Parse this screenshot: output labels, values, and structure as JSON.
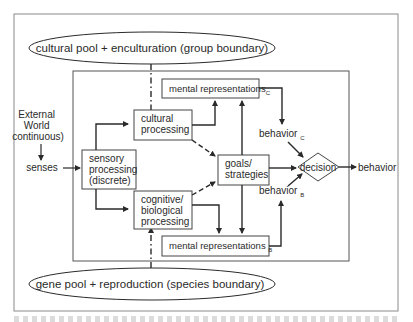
{
  "diagram": {
    "top_ellipse": {
      "label": "cultural  pool + enculturation (group boundary)"
    },
    "bottom_ellipse": {
      "label": "gene pool + reproduction (species boundary)"
    },
    "external_world": {
      "lines": [
        "External",
        "World",
        "continuous)"
      ]
    },
    "senses": {
      "label": "senses"
    },
    "sensory_processing": {
      "lines": [
        "sensory",
        "processing",
        "(discrete)"
      ]
    },
    "cultural_processing": {
      "lines": [
        "cultural",
        "processing"
      ]
    },
    "cognitive_processing": {
      "lines": [
        "cognitive/",
        "biological",
        "processing"
      ]
    },
    "mental_rep_c": {
      "label": "mental representations",
      "subscript": "C"
    },
    "mental_rep_b": {
      "label": "mental representations ",
      "subscript": "B"
    },
    "goals": {
      "lines": [
        "goals/",
        "strategies"
      ]
    },
    "behavior_c": {
      "label": "behavior ",
      "subscript": "C"
    },
    "behavior_b": {
      "label": "behavior ",
      "subscript": "B"
    },
    "decision": {
      "label": "decision"
    },
    "behavior_out": {
      "label": "behavior"
    }
  },
  "colors": {
    "line": "#2a2a2a",
    "frame": "#8a8a8a",
    "background": "#ffffff"
  }
}
